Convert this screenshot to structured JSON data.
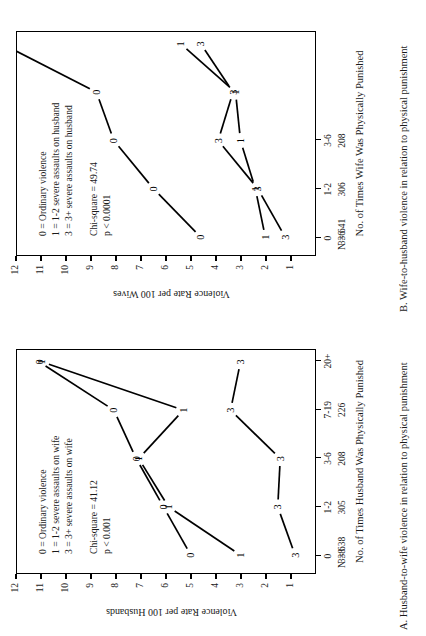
{
  "figure": {
    "orientation": "rotated-90-ccw",
    "ink_color": "#000000",
    "background": "#ffffff"
  },
  "panels": [
    {
      "id": "A",
      "caption": "A.  Husband-to-wife violence in relation to physical punishment",
      "y_axis_title": "Violence Rate per 100 Husbands",
      "x_axis_title": "No. of Times Husband Was Physically Punished",
      "n_total_label": "N = 638",
      "stats": {
        "chi_square": "Chi-square = 41.12",
        "p_value": "p < 0.001"
      },
      "legend": [
        "0 = Ordinary violence",
        "1 = 1-2 severe assaults on wife",
        "3 = 3+ severe assaults on wife"
      ],
      "chart_data": {
        "type": "line",
        "title": "A.  Husband-to-wife violence in relation to physical punishment",
        "xlabel": "No. of Times Husband Was Physically Punished",
        "ylabel": "Violence Rate per 100 Husbands",
        "categories": [
          "0",
          "1-2",
          "3-6",
          "7-19",
          "20+"
        ],
        "category_counts": [
          338,
          305,
          208,
          226
        ],
        "ylim": [
          0,
          12
        ],
        "yticks": [
          1,
          2,
          3,
          4,
          5,
          6,
          7,
          8,
          9,
          10,
          11,
          12
        ],
        "grid": false,
        "legend_position": "inside-upper-left",
        "point_markers": "series-digit",
        "series": [
          {
            "name": "0",
            "label": "0 = Ordinary violence",
            "values": [
              5.0,
              6.1,
              7.2,
              8.1,
              11.1
            ]
          },
          {
            "name": "1",
            "label": "1 = 1-2 severe assaults on wife",
            "values": [
              3.0,
              5.9,
              7.1,
              5.3,
              11.0
            ]
          },
          {
            "name": "3",
            "label": "3 = 3+ severe assaults on wife",
            "values": [
              0.8,
              1.5,
              1.4,
              3.4,
              3.0
            ]
          }
        ]
      }
    },
    {
      "id": "B",
      "caption": "B.  Wife-to-husband violence in relation to physical punishment",
      "y_axis_title": "Violence Rate per 100 Wives",
      "x_axis_title": "No. of Times Wife Was Physically Punished",
      "n_total_label": "N = 641",
      "stats": {
        "chi_square": "Chi-square = 49.74",
        "p_value": "p < 0.0001"
      },
      "legend": [
        "0 = Ordinary violence",
        "1 = 1-2 severe assaults on husband",
        "3 = 3+ severe assaults on husband"
      ],
      "chart_data": {
        "type": "line",
        "title": "B.  Wife-to-husband violence in relation to physical punishment",
        "xlabel": "No. of Times Wife Was Physically Punished",
        "ylabel": "Violence Rate per 100 Wives",
        "categories": [
          "0",
          "1-2",
          "3-6",
          "7-19",
          "20+"
        ],
        "category_counts": [
          336,
          306,
          208
        ],
        "ylim": [
          0,
          12
        ],
        "yticks": [
          1,
          2,
          3,
          4,
          5,
          6,
          7,
          8,
          9,
          10,
          11,
          12
        ],
        "grid": false,
        "legend_position": "inside-upper-left",
        "point_markers": "series-digit",
        "cropped_right": true,
        "series": [
          {
            "name": "0",
            "label": "0 = Ordinary violence",
            "values": [
              4.6,
              6.5,
              8.1,
              8.8,
              12.6
            ]
          },
          {
            "name": "1",
            "label": "1 = 1-2 severe assaults on husband",
            "values": [
              2.0,
              2.4,
              3.0,
              3.2,
              5.4
            ]
          },
          {
            "name": "3",
            "label": "3 = 3+ severe assaults on husband",
            "values": [
              1.2,
              2.3,
              3.9,
              3.3,
              4.6
            ]
          }
        ]
      }
    }
  ]
}
